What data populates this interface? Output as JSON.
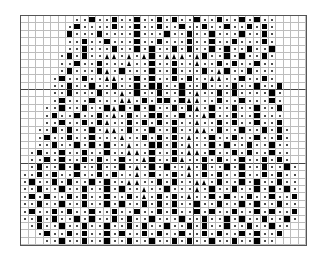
{
  "chart": {
    "title": "",
    "legend": {
      ".": "empty",
      "o": "dot-stitch",
      "#": "filled-square",
      "^": "triangle"
    },
    "heavy_cols": [
      22
    ],
    "heavy_rows": [
      9,
      19
    ],
    "rows": [
      ".......oo#oo#oo#oo#o#oo#oo#oo#o#oo....",
      "......o#oooo#oo#oo#oo#oo#oo#oo#o#o....",
      "......#ooo#oooo#ooo#oo#oo#ooo#oo#o....",
      "......oo#oo#ooo#oo#ooo#oo#oo#ooo#o....",
      "......oo#ooo#oo#o#oo#o#oo#o#oo#oo#....",
      ".....o#o#oo^^o^o^#o^^^o^#oo#o#oo#o....",
      ".....oo#oo#ooo^oo#oo#oo^oo#o#oo#oo....",
      ".....o#ooo#^o#ooo#oo#ooo#o^#oo#ooo....",
      "....o#oo#oo^^oo#o#oo#o#oo^^oo#oo#o....",
      "....oo#oo#oo#oo#o##oo#oo#ooo#oo#oo#...",
      "....oo#ooo#oo^o#oo#oo#o^oo#o#oooo#o...",
      "....o#ooo#ooo^^o#o##o#^^oo#oo#ooo#o...",
      "...oo#oo#oo#^#o#o#oo#o#^o#oo#oo#oo#...",
      "...o#oo#oo#o^o#oo##oo#oo^#oo#oo#ooo...",
      "...oo#oo#o#^oo#o#o#o#oo^oo#o#oo#oo#...",
      "..oo#o#oo#o^^o#oo#oo#oo^^o#oo#oo#o#o..",
      "..o#oo#oo#ooo^oo#o#o#o^oo#oo#oo#oo#o..",
      "..oo#oo#o#o#oo^oo##o#o^oo#o#oo#oo#oo..",
      ".o#oo#oo#oo#oo^^o#oo#o^^o#oo#o#oo#oo..",
      ".oo#o#oo#o#oo#oo^#oo#^oo#o#oo#oo#o#o..",
      ".o#oo#o#oo#oo#o^o#o#oo^o#oo#o#oo#oo#o.",
      "oo#o#oo#oo#o#oo^o#oo#o^o#o#oo#oo#o#oo.",
      "o#oo#o#oo#o#oo^^oo#o#oo^^o#oo#o#oo#oo.",
      "oo#oo#oo#oo#o#oo^oo#ooo^o#oo#oo#o#o#o.",
      "o#o#oo#o#oo#oo#o^o#o#o^oo#o#oo#oo#oo#.",
      "oo#oo#oo#oo#o#oo#o#o#oo#oo#oo#o#oo#oo.",
      "o#oo#o#oo#oo#oo#oo#o#oo#o#oo#oo#o#oo#.",
      "oo#o#oo#o#oo#o#oo#ooo#oo#oo#o#oo#oo#o.",
      ".o#oo#oo#oo#oo#o#oo#oo#o#oo#oo#oo#oo..",
      "..o#oo#o#oo#o#oo#o#oo#oo#o#oo#o#oo#...",
      "...oo#oo#oo#oo#oo#oo#o#oo#oo#oo#oo...."
    ]
  }
}
